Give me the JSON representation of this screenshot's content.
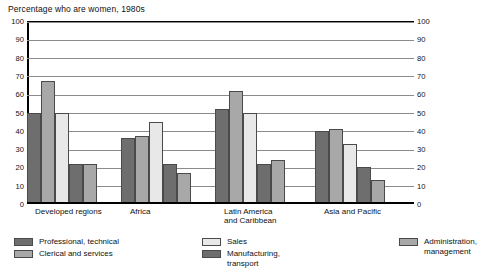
{
  "chart_data": {
    "type": "bar",
    "title": "Percentage who are women, 1980s",
    "xlabel": "",
    "ylabel": "",
    "ylim": [
      0,
      100
    ],
    "yticks": [
      0,
      10,
      20,
      30,
      40,
      50,
      60,
      70,
      80,
      90,
      100
    ],
    "grid": true,
    "dual_axis": true,
    "legend_position": "bottom",
    "categories": [
      "Developed regions",
      "Africa",
      "Latin America\nand Caribbean",
      "Asia and Pacific"
    ],
    "series": [
      {
        "name": "Professional, technical",
        "color": "#6e6e6e",
        "values": [
          50,
          36,
          52,
          40
        ]
      },
      {
        "name": "Clerical and services",
        "color": "#a8a8a8",
        "values": [
          67,
          37,
          62,
          41
        ]
      },
      {
        "name": "Sales",
        "color": "#e8e8e8",
        "values": [
          50,
          45,
          50,
          33
        ]
      },
      {
        "name": "Manufacturing,\ntransport",
        "color": "#6e6e6e",
        "values": [
          22,
          22,
          22,
          20
        ]
      },
      {
        "name": "Administration,\nmanagement",
        "color": "#a8a8a8",
        "values": [
          22,
          17,
          24,
          13
        ]
      }
    ]
  },
  "legend": {
    "column1": [
      {
        "label": "Professional, technical",
        "color": "#6e6e6e"
      },
      {
        "label": "Clerical and services",
        "color": "#a8a8a8"
      }
    ],
    "column2": [
      {
        "label": "Sales",
        "color": "#e8e8e8"
      },
      {
        "label": "Manufacturing,\ntransport",
        "color": "#6e6e6e"
      }
    ],
    "column3": [
      {
        "label": "Administration,\nmanagement",
        "color": "#a8a8a8"
      }
    ]
  }
}
